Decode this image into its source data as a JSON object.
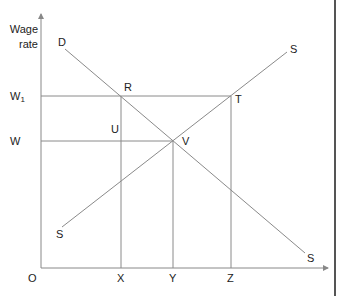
{
  "diagram": {
    "y_axis_label_line1": "Wage",
    "y_axis_label_line2": "rate",
    "origin": "O",
    "y_ticks": [
      {
        "label": "W",
        "sub": "1",
        "y": 96
      },
      {
        "label": "W",
        "sub": "",
        "y": 141
      }
    ],
    "x_ticks": [
      {
        "label": "X",
        "x": 121
      },
      {
        "label": "Y",
        "x": 173
      },
      {
        "label": "Z",
        "x": 231
      }
    ],
    "points": {
      "R": "R",
      "T": "T",
      "U": "U",
      "V": "V"
    },
    "curves": {
      "demand_label": "D",
      "demand_end_label": "S",
      "supply_top_label": "S",
      "supply_bottom_label": "S"
    },
    "colors": {
      "lines": "#8a8a8a",
      "text": "#222222"
    }
  }
}
